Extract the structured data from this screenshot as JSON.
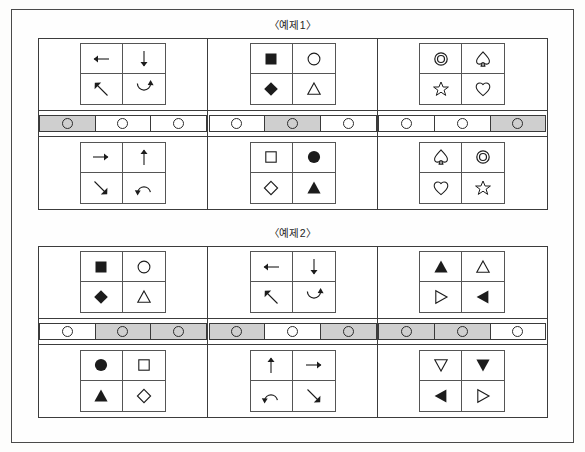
{
  "page": {
    "examples": [
      {
        "id": "example-1",
        "title": "〈예제1〉",
        "columns": [
          {
            "id": "ex1-col-1",
            "top_grid": {
              "glyphs": [
                "arrow-left",
                "arrow-down",
                "arrow-up-left",
                "arrow-rotate-cw"
              ]
            },
            "bar": {
              "cells": [
                {
                  "shaded": true
                },
                {
                  "shaded": false
                },
                {
                  "shaded": false
                }
              ]
            },
            "bottom_grid": {
              "glyphs": [
                "arrow-right",
                "arrow-up",
                "arrow-down-right",
                "arrow-rotate-ccw"
              ]
            }
          },
          {
            "id": "ex1-col-2",
            "top_grid": {
              "glyphs": [
                "square-filled",
                "circle-hollow",
                "diamond-filled",
                "triangle-up-hollow"
              ]
            },
            "bar": {
              "cells": [
                {
                  "shaded": false
                },
                {
                  "shaded": true
                },
                {
                  "shaded": false
                }
              ]
            },
            "bottom_grid": {
              "glyphs": [
                "square-hollow",
                "circle-filled",
                "diamond-hollow",
                "triangle-up-filled"
              ]
            }
          },
          {
            "id": "ex1-col-3",
            "top_grid": {
              "glyphs": [
                "double-circle",
                "spade-hollow",
                "star-hollow",
                "heart-hollow"
              ]
            },
            "bar": {
              "cells": [
                {
                  "shaded": false
                },
                {
                  "shaded": false
                },
                {
                  "shaded": true
                }
              ]
            },
            "bottom_grid": {
              "glyphs": [
                "spade-hollow",
                "double-circle",
                "heart-hollow",
                "star-hollow"
              ]
            }
          }
        ]
      },
      {
        "id": "example-2",
        "title": "〈예제2〉",
        "columns": [
          {
            "id": "ex2-col-1",
            "top_grid": {
              "glyphs": [
                "square-filled",
                "circle-hollow",
                "diamond-filled",
                "triangle-up-hollow"
              ]
            },
            "bar": {
              "cells": [
                {
                  "shaded": false
                },
                {
                  "shaded": true
                },
                {
                  "shaded": true
                }
              ]
            },
            "bottom_grid": {
              "glyphs": [
                "circle-filled",
                "square-hollow",
                "triangle-up-filled",
                "diamond-hollow"
              ]
            }
          },
          {
            "id": "ex2-col-2",
            "top_grid": {
              "glyphs": [
                "arrow-left",
                "arrow-down",
                "arrow-up-left",
                "arrow-rotate-cw"
              ]
            },
            "bar": {
              "cells": [
                {
                  "shaded": true
                },
                {
                  "shaded": false
                },
                {
                  "shaded": true
                }
              ]
            },
            "bottom_grid": {
              "glyphs": [
                "arrow-up",
                "arrow-right",
                "arrow-rotate-ccw",
                "arrow-down-right"
              ]
            }
          },
          {
            "id": "ex2-col-3",
            "top_grid": {
              "glyphs": [
                "triangle-up-filled",
                "triangle-up-hollow",
                "triangle-right-hollow",
                "triangle-left-filled"
              ]
            },
            "bar": {
              "cells": [
                {
                  "shaded": true
                },
                {
                  "shaded": true
                },
                {
                  "shaded": false
                }
              ]
            },
            "bottom_grid": {
              "glyphs": [
                "triangle-down-hollow",
                "triangle-down-filled",
                "triangle-left-filled",
                "triangle-right-hollow"
              ]
            }
          }
        ]
      }
    ]
  },
  "colors": {
    "shaded_cell": "#cfcfcf",
    "line": "#3c3c3c",
    "ink": "#1a1a1a",
    "paper": "#fdfdfc"
  }
}
